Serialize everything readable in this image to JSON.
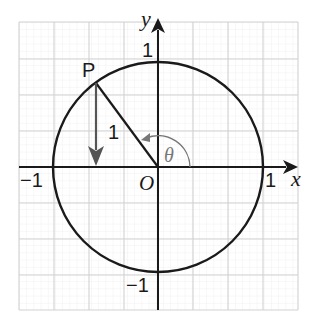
{
  "diagram": {
    "axes": {
      "x_label": "x",
      "y_label": "y",
      "origin_label": "O",
      "x_pos_tick": "1",
      "x_neg_tick": "−1",
      "y_pos_tick": "1",
      "y_neg_tick": "−1"
    },
    "point": {
      "label": "P"
    },
    "radius_label": "1",
    "angle_label": "θ",
    "colors": {
      "grid_minor": "#ececec",
      "grid_major": "#d0d0d0",
      "axis": "#1a1a1a",
      "circle": "#1a1a1a",
      "radius": "#1a1a1a",
      "drop_arrow": "#555555",
      "angle_arc": "#777777"
    }
  }
}
